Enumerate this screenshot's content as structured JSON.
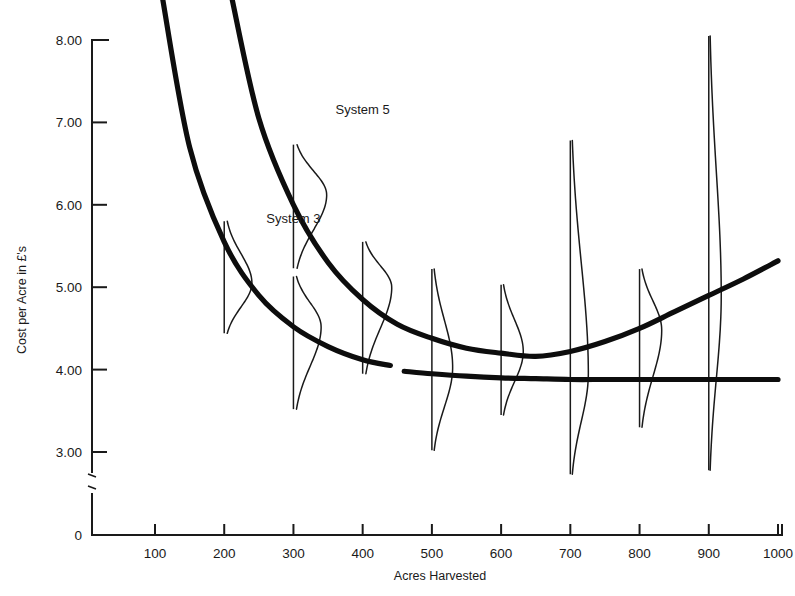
{
  "chart_data": {
    "type": "line",
    "title": "",
    "xlabel": "Acres Harvested",
    "ylabel": "Cost per Acre in £'s",
    "xlim": [
      0,
      1000
    ],
    "ylim": [
      3.0,
      8.4
    ],
    "y_axis_break": true,
    "y_zero_shown": true,
    "grid": false,
    "legend": "inline-labels",
    "x_ticks": [
      "100",
      "200",
      "300",
      "400",
      "500",
      "600",
      "700",
      "800",
      "900",
      "1000"
    ],
    "x_tick_values": [
      100,
      200,
      300,
      400,
      500,
      600,
      700,
      800,
      900,
      1000
    ],
    "y_ticks": [
      "0",
      "3.00",
      "4.00",
      "5.00",
      "6.00",
      "7.00",
      "8.00"
    ],
    "y_tick_values": [
      0,
      3.0,
      4.0,
      5.0,
      6.0,
      7.0,
      8.0
    ],
    "series": [
      {
        "name": "System 3",
        "label": "System 3",
        "label_x": 300,
        "label_y": 5.78,
        "x": [
          110,
          150,
          200,
          250,
          300,
          350,
          400,
          440,
          460,
          500,
          550,
          600,
          650,
          700,
          750,
          800,
          850,
          900,
          950,
          1000
        ],
        "y": [
          8.55,
          6.7,
          5.55,
          4.9,
          4.52,
          4.28,
          4.12,
          4.05,
          3.98,
          3.95,
          3.92,
          3.9,
          3.89,
          3.88,
          3.88,
          3.88,
          3.88,
          3.88,
          3.88,
          3.88
        ],
        "gap_between_x": [
          440,
          460
        ]
      },
      {
        "name": "System 5",
        "label": "System 5",
        "label_x": 400,
        "label_y": 7.1,
        "x": [
          210,
          250,
          300,
          350,
          400,
          450,
          500,
          550,
          600,
          650,
          700,
          750,
          800,
          850,
          900,
          950,
          1000
        ],
        "y": [
          8.55,
          7.05,
          6.0,
          5.3,
          4.85,
          4.55,
          4.38,
          4.26,
          4.2,
          4.16,
          4.22,
          4.34,
          4.5,
          4.7,
          4.9,
          5.1,
          5.32
        ]
      }
    ],
    "distributions": [
      {
        "at_x": 200,
        "system": "System 3",
        "min": 4.44,
        "max": 5.8,
        "mode": 5.05,
        "peak_width_acres": 40
      },
      {
        "at_x": 300,
        "system": "System 5",
        "min": 5.23,
        "max": 6.73,
        "mode": 6.12,
        "peak_width_acres": 48
      },
      {
        "at_x": 300,
        "system": "System 3",
        "min": 3.52,
        "max": 5.13,
        "mode": 4.52,
        "peak_width_acres": 40
      },
      {
        "at_x": 400,
        "system": "System 5",
        "min": 3.95,
        "max": 5.55,
        "mode": 5.0,
        "peak_width_acres": 42
      },
      {
        "at_x": 500,
        "system": "System 3",
        "min": 3.02,
        "max": 5.22,
        "mode": 4.03,
        "peak_width_acres": 30
      },
      {
        "at_x": 600,
        "system": "System 5",
        "min": 3.45,
        "max": 5.03,
        "mode": 4.22,
        "peak_width_acres": 32
      },
      {
        "at_x": 700,
        "system": "System 3",
        "min": 2.73,
        "max": 6.78,
        "mode": 3.95,
        "peak_width_acres": 26
      },
      {
        "at_x": 800,
        "system": "System 5",
        "min": 3.3,
        "max": 5.22,
        "mode": 4.48,
        "peak_width_acres": 32
      },
      {
        "at_x": 900,
        "system": "System 3",
        "min": 2.78,
        "max": 8.05,
        "mode": 4.9,
        "peak_width_acres": 18
      }
    ]
  },
  "axes": {
    "y_title": "Cost per Acre in £'s",
    "x_title": "Acres Harvested"
  },
  "colors": {
    "ink": "#1a1a1a",
    "curve": "#0d0d0d",
    "background": "#ffffff"
  }
}
